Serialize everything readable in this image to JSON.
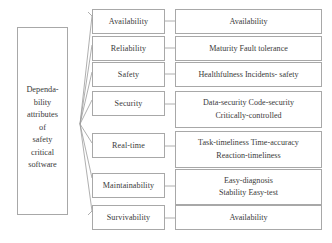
{
  "diagram": {
    "title_text": "Dependability attributes of safety critical software",
    "root": {
      "name": "dependability-attributes-root",
      "lines": [
        "Dependa-",
        "bility",
        "attributes",
        "of",
        "safety",
        "critical",
        "software"
      ]
    },
    "colors": {
      "border": "#a8a8a8",
      "text": "#3a3a3a",
      "connector": "#9a9a9a",
      "background": "#ffffff"
    },
    "rows": [
      {
        "id": "availability",
        "attribute": "Availability",
        "sub_lines": [
          "Availability"
        ]
      },
      {
        "id": "reliability",
        "attribute": "Reliability",
        "sub_lines": [
          "Maturity  Fault tolerance"
        ]
      },
      {
        "id": "safety",
        "attribute": "Safety",
        "sub_lines": [
          "Healthfulness    Incidents- safety"
        ]
      },
      {
        "id": "security",
        "attribute": "Security",
        "sub_lines": [
          "Data-security    Code-security",
          "Critically-controlled"
        ]
      },
      {
        "id": "real-time",
        "attribute": "Real-time",
        "sub_lines": [
          "Task-timeliness    Time-accuracy",
          "Reaction-timeliness"
        ]
      },
      {
        "id": "maintainability",
        "attribute": "Maintainability",
        "sub_lines": [
          "Easy-diagnosis",
          "Stability    Easy-test"
        ]
      },
      {
        "id": "survivability",
        "attribute": "Survivability",
        "sub_lines": [
          "Availability"
        ]
      }
    ]
  }
}
